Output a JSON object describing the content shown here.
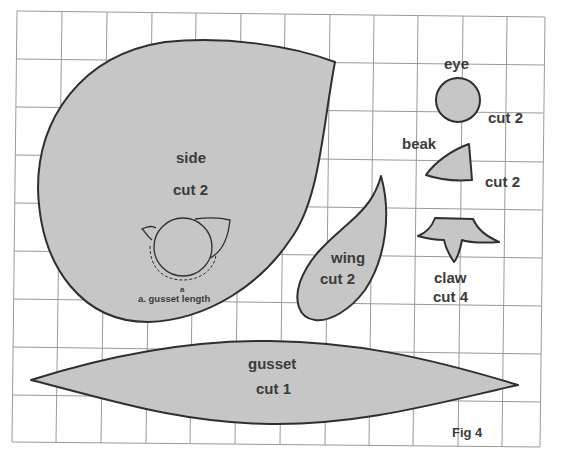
{
  "figure": {
    "caption": "Fig 4",
    "grid": {
      "columns": 11,
      "rows": 9,
      "line_color": "#9a9a9a"
    },
    "fill_color": "#c6c6c6",
    "outline_color": "#2f2f2f",
    "text_color": "#3b3b3b"
  },
  "pieces": {
    "side": {
      "name": "side",
      "instruction": "cut 2"
    },
    "eye": {
      "name": "eye",
      "instruction": "cut 2"
    },
    "beak": {
      "name": "beak",
      "instruction": "cut 2"
    },
    "wing": {
      "name": "wing",
      "instruction": "cut 2"
    },
    "claw": {
      "name": "claw",
      "instruction": "cut 4"
    },
    "gusset": {
      "name": "gusset",
      "instruction": "cut 1"
    }
  },
  "annotations": {
    "gusset_marker": "a",
    "gusset_legend": "a. gusset length"
  }
}
